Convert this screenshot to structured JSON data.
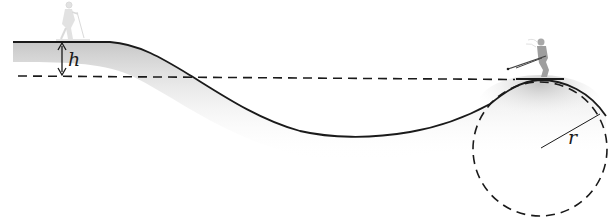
{
  "diagram": {
    "type": "physics-illustration",
    "labels": {
      "height": "h",
      "radius": "r"
    },
    "elements": {
      "terrain_profile": "solid curve: plateau, descent, valley, rounded hump",
      "reference_line": "dashed horizontal line at height h below plateau",
      "circle": "dashed circle of radius r matching hump curvature",
      "skier_start": "faded skier standing on plateau",
      "skier_top": "skier crouched on top of hump"
    },
    "colors": {
      "line": "#1a1a1a",
      "snow_shade": "#c8c8c8",
      "skier_faded": "#d0d0d0",
      "skier": "#9a9a9a",
      "background": "#ffffff"
    }
  }
}
